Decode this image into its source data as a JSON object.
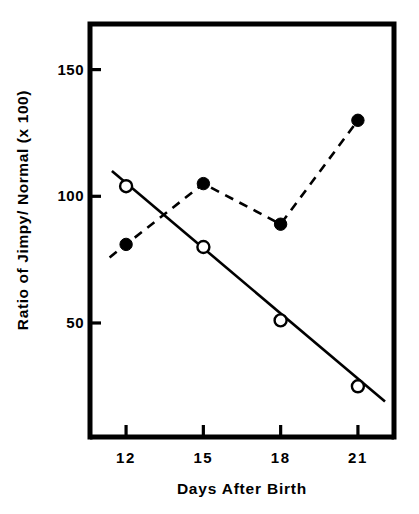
{
  "chart_data": {
    "type": "line",
    "title": "",
    "xlabel": "Days After Birth",
    "ylabel": "Ratio of Jimpy/ Normal (x 100)",
    "x": [
      12,
      15,
      18,
      21
    ],
    "xlim": [
      10.6,
      22.4
    ],
    "ylim": [
      5,
      168
    ],
    "xticks": [
      12,
      15,
      18,
      21
    ],
    "xtick_labels": [
      "12",
      "15",
      "18",
      "21"
    ],
    "yticks": [
      50,
      100,
      150
    ],
    "ytick_labels": [
      "50",
      "100",
      "150"
    ],
    "grid": false,
    "legend": "none",
    "series": [
      {
        "name": "filled-circles-dashed",
        "marker": "filled-circle",
        "linestyle": "dashed",
        "color": "#000000",
        "values": [
          81,
          105,
          89,
          130
        ]
      },
      {
        "name": "open-circles-solid-fit",
        "marker": "open-circle",
        "linestyle": "solid",
        "color": "#000000",
        "values": [
          104,
          80,
          51,
          25
        ]
      }
    ],
    "fit_line": {
      "name": "regression-line",
      "linestyle": "solid",
      "x_start": 11.45,
      "y_start": 110,
      "x_end": 22.05,
      "y_end": 19
    }
  },
  "axis": {
    "ylabel_text": "Ratio of Jimpy/ Normal (x 100)",
    "xlabel_text": "Days After Birth",
    "ytick_labels": [
      "150",
      "100",
      "50"
    ],
    "xtick_labels": [
      "12",
      "15",
      "18",
      "21"
    ]
  },
  "colors": {
    "ink": "#000000",
    "background": "#ffffff"
  }
}
